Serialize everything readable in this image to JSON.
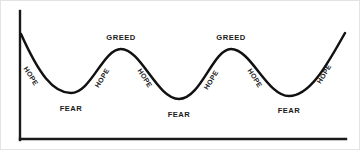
{
  "chart_data": {
    "type": "line",
    "title": "",
    "subtitle": "",
    "xlabel": "",
    "ylabel": "",
    "xlim": [
      0,
      360
    ],
    "ylim": [
      0,
      150
    ],
    "grid": false,
    "legend": null,
    "series": [
      {
        "name": "Market Emotion Cycle",
        "color": "#111111",
        "points": [
          {
            "x": 20,
            "y": 33
          },
          {
            "x": 70,
            "y": 92
          },
          {
            "x": 120,
            "y": 48
          },
          {
            "x": 178,
            "y": 98
          },
          {
            "x": 230,
            "y": 48
          },
          {
            "x": 288,
            "y": 95
          },
          {
            "x": 344,
            "y": 32
          }
        ],
        "path": "M 20 33 C 38 73, 52 92, 70 92 C 90 92, 102 48, 120 48 C 140 48, 156 98, 178 98 C 200 98, 212 48, 230 48 C 250 48, 266 95, 288 95 C 310 95, 328 60, 344 32"
      }
    ],
    "annotations": [
      {
        "id": "hope-1",
        "text": "HOPE",
        "x": 30,
        "y": 75,
        "rotation": 58,
        "phase": "descent",
        "anchor": "slope"
      },
      {
        "id": "fear-1",
        "text": "FEAR",
        "x": 70,
        "y": 108,
        "rotation": 0,
        "phase": "trough",
        "anchor": "below-trough"
      },
      {
        "id": "hope-2",
        "text": "HOPE",
        "x": 101,
        "y": 77,
        "rotation": -58,
        "phase": "ascent",
        "anchor": "slope"
      },
      {
        "id": "greed-1",
        "text": "GREED",
        "x": 120,
        "y": 37,
        "rotation": 0,
        "phase": "peak",
        "anchor": "above-peak"
      },
      {
        "id": "hope-3",
        "text": "HOPE",
        "x": 144,
        "y": 77,
        "rotation": 58,
        "phase": "descent",
        "anchor": "slope"
      },
      {
        "id": "fear-2",
        "text": "FEAR",
        "x": 178,
        "y": 114,
        "rotation": 0,
        "phase": "trough",
        "anchor": "below-trough"
      },
      {
        "id": "hope-4",
        "text": "HOPE",
        "x": 210,
        "y": 79,
        "rotation": -58,
        "phase": "ascent",
        "anchor": "slope"
      },
      {
        "id": "greed-2",
        "text": "GREED",
        "x": 230,
        "y": 37,
        "rotation": 0,
        "phase": "peak",
        "anchor": "above-peak"
      },
      {
        "id": "hope-5",
        "text": "HOPE",
        "x": 254,
        "y": 77,
        "rotation": 58,
        "phase": "descent",
        "anchor": "slope"
      },
      {
        "id": "fear-3",
        "text": "FEAR",
        "x": 288,
        "y": 110,
        "rotation": 0,
        "phase": "trough",
        "anchor": "below-trough"
      },
      {
        "id": "hope-6",
        "text": "HOPE",
        "x": 323,
        "y": 73,
        "rotation": -58,
        "phase": "ascent",
        "anchor": "slope"
      }
    ],
    "axes": {
      "y_axis": {
        "x": 19,
        "y_top": 10,
        "y_bottom": 139,
        "color": "#1a1a1a"
      },
      "x_axis": {
        "y": 138,
        "x_left": 19,
        "x_right": 345,
        "color": "#1a1a1a"
      },
      "ticks": [],
      "tick_labels": []
    },
    "colors": {
      "background": "#ffffff",
      "border": "#e3e3e3",
      "curve": "#111111",
      "axis": "#1a1a1a",
      "label_text": "#1a1a1a"
    }
  }
}
